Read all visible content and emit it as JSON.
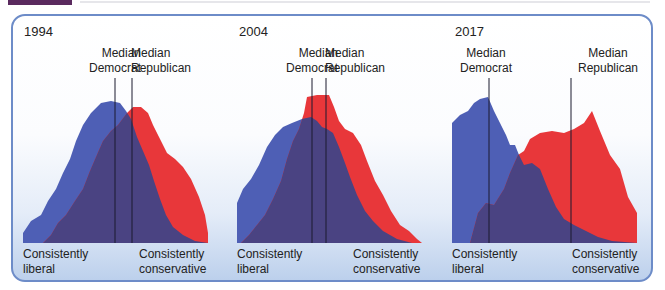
{
  "colors": {
    "democrat": "#4e5fb5",
    "republican": "#e8373a",
    "overlap": "#4a4382",
    "median_line": "#1a1a2e",
    "panel_border": "#6d8cc8"
  },
  "chart_data": [
    {
      "type": "area",
      "title": "1994",
      "xlabel_left": "Consistently liberal",
      "xlabel_right": "Consistently conservative",
      "median_labels": [
        "Median Democrat",
        "Median Republican"
      ],
      "x_range": [
        0,
        185
      ],
      "series": [
        {
          "name": "Democrats",
          "color": "#4e5fb5",
          "points": [
            [
              0,
              150
            ],
            [
              0,
              140
            ],
            [
              8,
              128
            ],
            [
              18,
              122
            ],
            [
              25,
              108
            ],
            [
              33,
              96
            ],
            [
              40,
              80
            ],
            [
              47,
              66
            ],
            [
              53,
              48
            ],
            [
              60,
              32
            ],
            [
              68,
              20
            ],
            [
              78,
              10
            ],
            [
              88,
              8
            ],
            [
              97,
              10
            ],
            [
              103,
              18
            ],
            [
              108,
              26
            ],
            [
              114,
              44
            ],
            [
              120,
              58
            ],
            [
              126,
              72
            ],
            [
              131,
              88
            ],
            [
              137,
              106
            ],
            [
              143,
              122
            ],
            [
              150,
              134
            ],
            [
              160,
              142
            ],
            [
              172,
              148
            ],
            [
              185,
              150
            ]
          ]
        },
        {
          "name": "Republicans",
          "color": "#e8373a",
          "points": [
            [
              20,
              150
            ],
            [
              28,
              142
            ],
            [
              35,
              130
            ],
            [
              43,
              122
            ],
            [
              52,
              108
            ],
            [
              60,
              96
            ],
            [
              67,
              78
            ],
            [
              73,
              64
            ],
            [
              80,
              48
            ],
            [
              88,
              38
            ],
            [
              95,
              32
            ],
            [
              104,
              20
            ],
            [
              110,
              14
            ],
            [
              118,
              14
            ],
            [
              125,
              20
            ],
            [
              130,
              32
            ],
            [
              136,
              44
            ],
            [
              144,
              60
            ],
            [
              152,
              66
            ],
            [
              160,
              74
            ],
            [
              168,
              86
            ],
            [
              176,
              104
            ],
            [
              182,
              122
            ],
            [
              185,
              140
            ],
            [
              185,
              150
            ]
          ]
        }
      ],
      "medians": {
        "democrat_x": 92,
        "republican_x": 109
      }
    },
    {
      "type": "area",
      "title": "2004",
      "xlabel_left": "Consistently liberal",
      "xlabel_right": "Consistently conservative",
      "median_labels": [
        "Median Democrat",
        "Median Republican"
      ],
      "x_range": [
        0,
        185
      ],
      "series": [
        {
          "name": "Democrats",
          "color": "#4e5fb5",
          "points": [
            [
              0,
              150
            ],
            [
              0,
              110
            ],
            [
              6,
              96
            ],
            [
              14,
              86
            ],
            [
              22,
              72
            ],
            [
              30,
              54
            ],
            [
              38,
              42
            ],
            [
              46,
              34
            ],
            [
              55,
              30
            ],
            [
              65,
              26
            ],
            [
              74,
              24
            ],
            [
              80,
              28
            ],
            [
              85,
              34
            ],
            [
              90,
              36
            ],
            [
              96,
              40
            ],
            [
              102,
              54
            ],
            [
              108,
              70
            ],
            [
              113,
              84
            ],
            [
              120,
              102
            ],
            [
              128,
              118
            ],
            [
              136,
              128
            ],
            [
              146,
              138
            ],
            [
              160,
              146
            ],
            [
              175,
              150
            ],
            [
              185,
              150
            ]
          ]
        },
        {
          "name": "Republicans",
          "color": "#e8373a",
          "points": [
            [
              4,
              150
            ],
            [
              12,
              142
            ],
            [
              20,
              132
            ],
            [
              28,
              122
            ],
            [
              36,
              106
            ],
            [
              44,
              88
            ],
            [
              50,
              66
            ],
            [
              56,
              48
            ],
            [
              62,
              36
            ],
            [
              67,
              20
            ],
            [
              70,
              4
            ],
            [
              80,
              2
            ],
            [
              92,
              2
            ],
            [
              97,
              14
            ],
            [
              102,
              28
            ],
            [
              108,
              36
            ],
            [
              116,
              40
            ],
            [
              124,
              52
            ],
            [
              130,
              68
            ],
            [
              138,
              88
            ],
            [
              146,
              102
            ],
            [
              154,
              118
            ],
            [
              163,
              132
            ],
            [
              172,
              138
            ],
            [
              180,
              146
            ],
            [
              185,
              150
            ]
          ]
        }
      ],
      "medians": {
        "democrat_x": 75,
        "republican_x": 89
      }
    },
    {
      "type": "area",
      "title": "2017",
      "xlabel_left": "Consistently liberal",
      "xlabel_right": "Consistently conservative",
      "median_labels": [
        "Median Democrat",
        "Median Republican"
      ],
      "x_range": [
        0,
        185
      ],
      "series": [
        {
          "name": "Democrats",
          "color": "#4e5fb5",
          "points": [
            [
              0,
              150
            ],
            [
              0,
              30
            ],
            [
              8,
              22
            ],
            [
              16,
              18
            ],
            [
              22,
              10
            ],
            [
              28,
              6
            ],
            [
              36,
              4
            ],
            [
              42,
              18
            ],
            [
              48,
              30
            ],
            [
              54,
              42
            ],
            [
              58,
              52
            ],
            [
              63,
              52
            ],
            [
              67,
              62
            ],
            [
              72,
              72
            ],
            [
              80,
              70
            ],
            [
              88,
              76
            ],
            [
              96,
              96
            ],
            [
              104,
              114
            ],
            [
              112,
              126
            ],
            [
              122,
              132
            ],
            [
              134,
              138
            ],
            [
              146,
              144
            ],
            [
              160,
              148
            ],
            [
              185,
              150
            ]
          ]
        },
        {
          "name": "Republicans",
          "color": "#e8373a",
          "points": [
            [
              18,
              150
            ],
            [
              26,
              120
            ],
            [
              34,
              110
            ],
            [
              42,
              112
            ],
            [
              52,
              96
            ],
            [
              58,
              80
            ],
            [
              66,
              62
            ],
            [
              72,
              58
            ],
            [
              78,
              46
            ],
            [
              88,
              40
            ],
            [
              100,
              38
            ],
            [
              112,
              40
            ],
            [
              122,
              36
            ],
            [
              132,
              30
            ],
            [
              140,
              18
            ],
            [
              148,
              38
            ],
            [
              158,
              62
            ],
            [
              168,
              76
            ],
            [
              176,
              104
            ],
            [
              185,
              120
            ],
            [
              185,
              150
            ]
          ]
        }
      ],
      "medians": {
        "democrat_x": 37,
        "republican_x": 119
      }
    }
  ]
}
